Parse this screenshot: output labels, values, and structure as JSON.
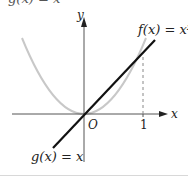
{
  "header": {
    "cut_off_text": "g(x) = x"
  },
  "diagram": {
    "axes": {
      "x_label": "x",
      "y_label": "y",
      "origin_label": "O",
      "tick_label_x": "1"
    },
    "curves": [
      {
        "name": "f",
        "label": "f(x) = x²",
        "expression": "x^2",
        "color": "#c8c8c8"
      },
      {
        "name": "g",
        "label": "g(x) = x",
        "expression": "x",
        "color": "#111111"
      }
    ],
    "annotations": {
      "intersection_point": "(1, 1)",
      "dashed_line": "x = 1"
    },
    "colors": {
      "axis": "#555555",
      "parabola": "#c8c8c8",
      "line": "#111111",
      "dashed": "#888888"
    }
  }
}
